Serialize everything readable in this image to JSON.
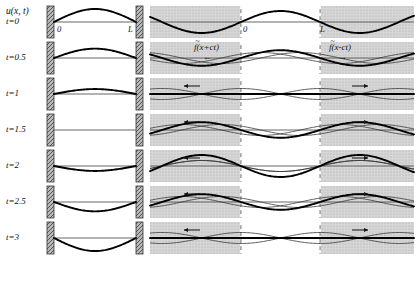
{
  "figure": {
    "axis_label": "u(x, t)",
    "tick_left": "0",
    "tick_right": "L",
    "caption": ""
  },
  "left_panel": {
    "name": "vibrating-string-snapshots",
    "wall_left_label": "0",
    "wall_right_label": "L",
    "rows": [
      {
        "time_label": "t=0",
        "amplitude": 1.0,
        "flat": false
      },
      {
        "time_label": "t=0.5",
        "amplitude": 0.72,
        "flat": false
      },
      {
        "time_label": "t=1",
        "amplitude": 0.38,
        "flat": false
      },
      {
        "time_label": "t=1.5",
        "amplitude": 0.0,
        "flat": true
      },
      {
        "time_label": "t=2",
        "amplitude": -0.38,
        "flat": false
      },
      {
        "time_label": "t=2.5",
        "amplitude": -0.72,
        "flat": false
      },
      {
        "time_label": "t=3",
        "amplitude": -1.0,
        "flat": false
      }
    ]
  },
  "right_panel": {
    "name": "dalembert-decomposition",
    "left_wave_label": "f(x+ct)",
    "right_wave_label": "f(x-ct)",
    "left_arrow": "←",
    "right_arrow": "→",
    "tick_left": "0",
    "tick_right": "L",
    "shading_color": "#d4d4d4",
    "rows": [
      {
        "time_label": "t=0",
        "shift": 0.0
      },
      {
        "time_label": "t=0.5",
        "shift": 0.25
      },
      {
        "time_label": "t=1",
        "shift": 0.5
      },
      {
        "time_label": "t=1.5",
        "shift": 0.75
      },
      {
        "time_label": "t=2",
        "shift": 1.0
      },
      {
        "time_label": "t=2.5",
        "shift": 1.25
      },
      {
        "time_label": "t=3",
        "shift": 1.5
      }
    ]
  },
  "colors": {
    "line": "#000000",
    "thin_line": "#333333",
    "wall_fill": "#9a9a9a",
    "shade": "#d3d3d3",
    "baseline": "#555555"
  }
}
